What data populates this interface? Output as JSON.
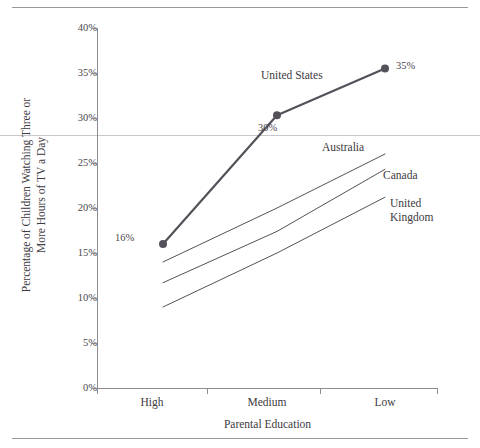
{
  "chart_data": {
    "type": "line",
    "title": "",
    "xlabel": "Parental Education",
    "ylabel": "Percentage of Children Watching Three or\nMore Hours of TV a Day",
    "categories": [
      "High",
      "Medium",
      "Low"
    ],
    "ylim": [
      0,
      40
    ],
    "ytick_labels": [
      "0%",
      "5%",
      "10%",
      "15%",
      "20%",
      "25%",
      "30%",
      "35%",
      "40%"
    ],
    "ytick_values": [
      0,
      5,
      10,
      15,
      20,
      25,
      30,
      35,
      40
    ],
    "grid": false,
    "legend_position": "inline-right",
    "series": [
      {
        "name": "United States",
        "values": [
          16.0,
          30.3,
          35.5
        ],
        "color": "#55515a",
        "markers": true,
        "line_width": 2.2,
        "data_labels": [
          "16%",
          "30%",
          "35%"
        ]
      },
      {
        "name": "Australia",
        "values": [
          14.0,
          20.0,
          26.0
        ],
        "color": "#55515a",
        "markers": false,
        "line_width": 1,
        "data_labels": []
      },
      {
        "name": "Canada",
        "values": [
          11.7,
          17.4,
          24.3
        ],
        "color": "#55515a",
        "markers": false,
        "line_width": 1,
        "data_labels": []
      },
      {
        "name": "United Kingdom",
        "values": [
          9.0,
          15.0,
          21.2
        ],
        "color": "#55515a",
        "markers": false,
        "line_width": 1,
        "data_labels": []
      }
    ],
    "annotations": [
      {
        "text": "United States",
        "for": "United States"
      },
      {
        "text": "Australia",
        "for": "Australia"
      },
      {
        "text": "Canada",
        "for": "Canada"
      },
      {
        "text": "United\nKingdom",
        "for": "United Kingdom"
      }
    ]
  },
  "axis": {
    "y_title_line1": "Percentage of Children Watching Three or",
    "y_title_line2": "More Hours of TV a Day",
    "x_title": "Parental Education",
    "yticks": [
      "40%",
      "35%",
      "30%",
      "25%",
      "20%",
      "15%",
      "10%",
      "5%",
      "0%"
    ],
    "xticks": [
      "High",
      "Medium",
      "Low"
    ]
  },
  "labels": {
    "us": "United States",
    "australia": "Australia",
    "canada": "Canada",
    "uk": "United\nKingdom",
    "v_high": "16%",
    "v_medium": "30%",
    "v_low": "35%"
  },
  "colors": {
    "series": "#55515a",
    "axis": "#8d8a90",
    "text": "#3d3a40",
    "rule": "#9a979c"
  }
}
